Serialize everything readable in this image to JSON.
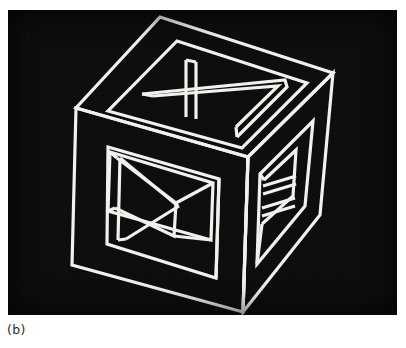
{
  "figure": {
    "caption": "(b)",
    "plate": {
      "background_color": "#0d0c0c",
      "line_color": "#f2f0ec",
      "page_color": "#ffffff",
      "x": 8,
      "y": 10,
      "width": 389,
      "height": 305
    },
    "drawing": {
      "type": "line-drawing",
      "subject": "impossible-cube",
      "stroke_width": 3.2,
      "view_box": "0 0 389 305",
      "outer_cube": {
        "top_apex": [
          152,
          7
        ],
        "left_corner": [
          68,
          98
        ],
        "right_corner": [
          325,
          63
        ],
        "front_top": [
          240,
          147
        ],
        "left_bottom": [
          64,
          255
        ],
        "front_bottom": [
          235,
          302
        ],
        "right_bottom": [
          312,
          205
        ]
      },
      "paths": {
        "top_face_outer": "M 152 7 L 325 63 L 240 147 L 68 98 Z",
        "top_face_inner": "M 167 30 L 300 73 L 233 139 L 99 100 Z",
        "top_window_outer": "M 150 100 L 270 67 L 278 73 L 228 124 L 222 123 Z",
        "top_window_inner": "M 160 97 L 266 73 L 232 113 Z",
        "left_face_outer": "M 68 98 L 240 147 L 235 302 L 64 255 Z",
        "left_face_inner": "M 100 135 L 212 168 L 209 268 L 99 234 Z",
        "left_window_front": "M 101 140 L 206 172 L 204 230 L 100 205 Z",
        "left_window_inner_recess": "M 108 145 L 166 192 L 163 225 L 106 200 Z",
        "left_diagonal_a": "M 104 142 L 166 191",
        "left_diagonal_b": "M 125 230 L 168 192",
        "right_face_outer": "M 240 147 L 325 63 L 312 205 L 235 302 Z",
        "right_face_inner": "M 252 163 L 305 110 L 298 196 L 250 254 Z",
        "right_window": "M 256 168 L 288 138 L 284 188 L 254 216 Z",
        "right_rung_top": "M 256 176 L 290 165",
        "right_rung_mid": "M 255 199 L 288 188"
      }
    }
  }
}
